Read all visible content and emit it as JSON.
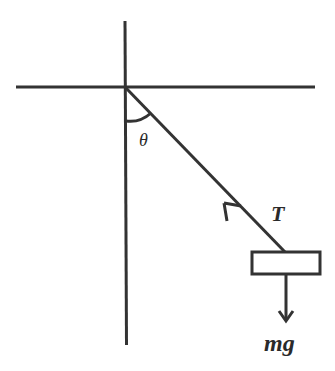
{
  "diagram": {
    "stroke_color": "#333333",
    "labels": {
      "angle": "θ",
      "tension": "T",
      "weight": "mg"
    },
    "geometry": {
      "pivot": [
        125,
        87
      ],
      "horizontal_line": {
        "x1": 16,
        "y1": 87,
        "x2": 315,
        "y2": 87
      },
      "vertical_line": {
        "x1": 125,
        "y1": 21,
        "x2": 127,
        "y2": 345
      },
      "string": {
        "x1": 125,
        "y1": 87,
        "x2": 285,
        "y2": 252
      },
      "mass_box": {
        "x": 252,
        "y": 252,
        "width": 68,
        "height": 22
      },
      "weight_arrow": {
        "x1": 286,
        "y1": 274,
        "x2": 286,
        "y2": 320
      }
    }
  }
}
